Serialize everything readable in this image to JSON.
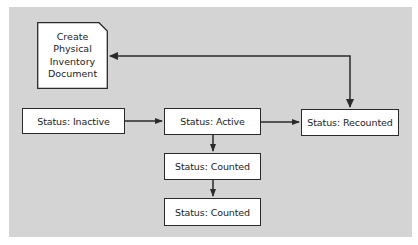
{
  "diagram": {
    "nodes": {
      "create_doc": "Create\nPhysical\nInventory\nDocument",
      "inactive": "Status: Inactive",
      "active": "Status: Active",
      "recounted": "Status: Recounted",
      "counted_1": "Status: Counted",
      "counted_2": "Status: Counted"
    },
    "edges": [
      {
        "from": "inactive",
        "to": "active"
      },
      {
        "from": "active",
        "to": "recounted"
      },
      {
        "from": "active",
        "to": "counted_1"
      },
      {
        "from": "counted_1",
        "to": "counted_2"
      },
      {
        "from": "recounted",
        "to": "create_doc"
      }
    ],
    "colors": {
      "background": "#d4d4d4",
      "box_fill": "#ffffff",
      "line": "#2a2a2a"
    }
  }
}
